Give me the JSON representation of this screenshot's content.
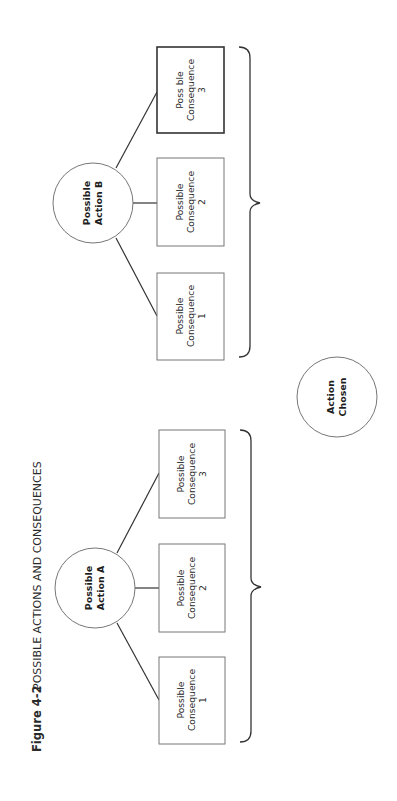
{
  "figure": {
    "number": "Figure  4-2",
    "title": "POSSIBLE ACTIONS AND CONSEQUENCES"
  },
  "groups": [
    {
      "id": "A",
      "action": [
        "Possible",
        "Action A"
      ],
      "consequences": [
        {
          "lines": [
            "Possible",
            "Consequence",
            "1"
          ],
          "emphasized": false
        },
        {
          "lines": [
            "Possible",
            "Consequence",
            "2"
          ],
          "emphasized": false
        },
        {
          "lines": [
            "Possible",
            "Consequence",
            "3"
          ],
          "emphasized": false
        }
      ]
    },
    {
      "id": "B",
      "action": [
        "Possible",
        "Action B"
      ],
      "consequences": [
        {
          "lines": [
            "Possible",
            "Consequence",
            "1"
          ],
          "emphasized": false
        },
        {
          "lines": [
            "Possible",
            "Consequence",
            "2"
          ],
          "emphasized": false
        },
        {
          "lines": [
            "Poss ble",
            "Consequence",
            "3"
          ],
          "emphasized": true
        }
      ]
    }
  ],
  "outcome": [
    "Action",
    "Chosen"
  ],
  "colors": {
    "line": "#333333",
    "box_border": "#777777",
    "background": "#ffffff"
  }
}
